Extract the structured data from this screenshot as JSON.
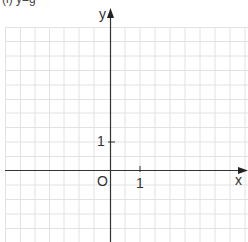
{
  "caption_fragment": "(i) y=g",
  "plane": {
    "x_axis_label": "x",
    "y_axis_label": "y",
    "origin_label": "O",
    "x_tick_label": "1",
    "y_tick_label": "1",
    "grid_color": "#e0e0e0",
    "axis_color": "#333333"
  }
}
